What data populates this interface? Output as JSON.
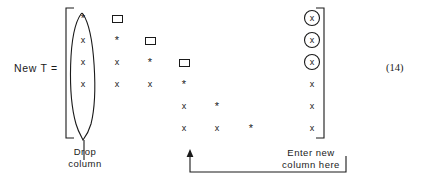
{
  "figure": {
    "lhs_label": "New T =",
    "equation_number": "(14)",
    "glyphs": {
      "x": "x",
      "star": "*",
      "box": "box-glyph"
    },
    "annotations": {
      "drop_column": "Drop\ncolumn",
      "enter_column": "Enter new\ncolumn here"
    },
    "matrix": {
      "rows": 6,
      "cols": 8,
      "bracket": "square",
      "cells": [
        [
          {
            "col": 1,
            "glyph": "*"
          },
          {
            "col": 2,
            "glyph": "box-glyph"
          },
          {
            "col": 8,
            "glyph": "x",
            "circled": true
          }
        ],
        [
          {
            "col": 1,
            "glyph": "x"
          },
          {
            "col": 2,
            "glyph": "*"
          },
          {
            "col": 3,
            "glyph": "box-glyph"
          },
          {
            "col": 8,
            "glyph": "x",
            "circled": true
          }
        ],
        [
          {
            "col": 1,
            "glyph": "x"
          },
          {
            "col": 2,
            "glyph": "x"
          },
          {
            "col": 3,
            "glyph": "*"
          },
          {
            "col": 4,
            "glyph": "box-glyph"
          },
          {
            "col": 8,
            "glyph": "x",
            "circled": true
          }
        ],
        [
          {
            "col": 1,
            "glyph": "x"
          },
          {
            "col": 2,
            "glyph": "x"
          },
          {
            "col": 3,
            "glyph": "x"
          },
          {
            "col": 4,
            "glyph": "*"
          },
          {
            "col": 8,
            "glyph": "x"
          }
        ],
        [
          {
            "col": 4,
            "glyph": "x"
          },
          {
            "col": 5,
            "glyph": "*"
          },
          {
            "col": 8,
            "glyph": "x"
          }
        ],
        [
          {
            "col": 4,
            "glyph": "x"
          },
          {
            "col": 5,
            "glyph": "x"
          },
          {
            "col": 6,
            "glyph": "*"
          },
          {
            "col": 8,
            "glyph": "x"
          }
        ]
      ]
    },
    "markers": {
      "dropped_column_index": 1,
      "entered_column_index": 4,
      "circled_column_index": 8,
      "circled_row_indices": [
        1,
        2,
        3
      ]
    },
    "colors": {
      "ink": "#1a1a1a",
      "background": "#ffffff"
    }
  }
}
